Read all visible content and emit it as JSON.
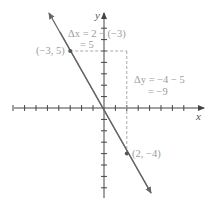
{
  "diagram": {
    "type": "coordinate-plane-line",
    "axes": {
      "x_label": "x",
      "y_label": "y",
      "x_ticks": [
        -8,
        -7,
        -6,
        -5,
        -4,
        -3,
        -2,
        -1,
        1,
        2,
        3,
        4,
        5,
        6,
        7,
        8
      ],
      "y_ticks": [
        -8,
        -7,
        -6,
        -5,
        -4,
        -3,
        -2,
        -1,
        1,
        2,
        3,
        4,
        5,
        6,
        7
      ]
    },
    "points": [
      {
        "label": "(−3, 5)",
        "x": -3,
        "y": 5
      },
      {
        "label": "(2, −4)",
        "x": 2,
        "y": -4
      }
    ],
    "annotations": {
      "delta_x_line1": "Δx = 2 − (−3)",
      "delta_x_line2": "= 5",
      "delta_y_line1": "Δy = −4 − 5",
      "delta_y_line2": "= −9"
    },
    "colors": {
      "line": "#555555",
      "axis": "#444444",
      "dashed": "#aaaaaa",
      "label": "#9c9c9c"
    }
  }
}
